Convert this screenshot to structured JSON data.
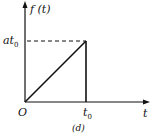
{
  "diagram": {
    "y_axis_label": "f (t)",
    "x_axis_label": "t",
    "origin_label": "O",
    "y_tick_label_main": "at",
    "y_tick_label_sub": "0",
    "x_tick_label_main": "t",
    "x_tick_label_sub": "0",
    "caption": "(d)",
    "line_color": "#111111"
  }
}
